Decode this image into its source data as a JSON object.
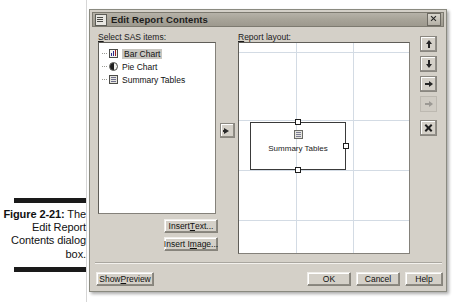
{
  "figure": {
    "caption_label": "Figure 2-21:",
    "caption_body": "The Edit Report Contents dialog box."
  },
  "dialog": {
    "title": "Edit Report Contents",
    "title_icon": "document-window-icon",
    "close_icon": "close-icon"
  },
  "left_panel": {
    "label": "Select SAS items:",
    "label_mnemonic": "S",
    "items": [
      {
        "label": "Bar Chart",
        "icon": "bar-chart-icon",
        "selected": true
      },
      {
        "label": "Pie Chart",
        "icon": "pie-chart-icon",
        "selected": false
      },
      {
        "label": "Summary Tables",
        "icon": "summary-table-icon",
        "selected": false
      }
    ],
    "buttons": [
      {
        "name": "insert-text",
        "label": "Insert Text...",
        "mnemonic": "T"
      },
      {
        "name": "insert-image",
        "label": "Insert Image...",
        "mnemonic": "m"
      }
    ]
  },
  "transfer": {
    "name": "add-to-layout-button",
    "icon": "arrow-right-icon"
  },
  "right_panel": {
    "label": "Report layout:",
    "label_mnemonic": "R",
    "canvas": {
      "grid_color": "#d3dbe4",
      "grid_vertical_x": [
        57,
        114
      ],
      "grid_horizontal_y": [
        9,
        77,
        127,
        177
      ],
      "objects": [
        {
          "name": "summary-tables-object",
          "label": "Summary Tables",
          "icon": "summary-table-icon",
          "selected": true,
          "x": 11,
          "y": 79,
          "width": 96,
          "height": 48,
          "handles": [
            "top",
            "right",
            "bottom"
          ]
        }
      ]
    },
    "toolbar": [
      {
        "name": "move-up-button",
        "icon": "arrow-up-icon",
        "enabled": true
      },
      {
        "name": "move-down-button",
        "icon": "arrow-down-icon",
        "enabled": true
      },
      {
        "name": "bring-forward-button",
        "icon": "arrow-right-icon",
        "enabled": true
      },
      {
        "name": "send-backward-button",
        "icon": "arrow-right-icon",
        "enabled": false
      },
      {
        "name": "delete-button",
        "icon": "x-close-icon",
        "enabled": true
      }
    ]
  },
  "footer": {
    "show_preview": {
      "label": "Show Preview",
      "mnemonic": "P"
    },
    "ok": {
      "label": "OK"
    },
    "cancel": {
      "label": "Cancel"
    },
    "help": {
      "label": "Help"
    }
  }
}
